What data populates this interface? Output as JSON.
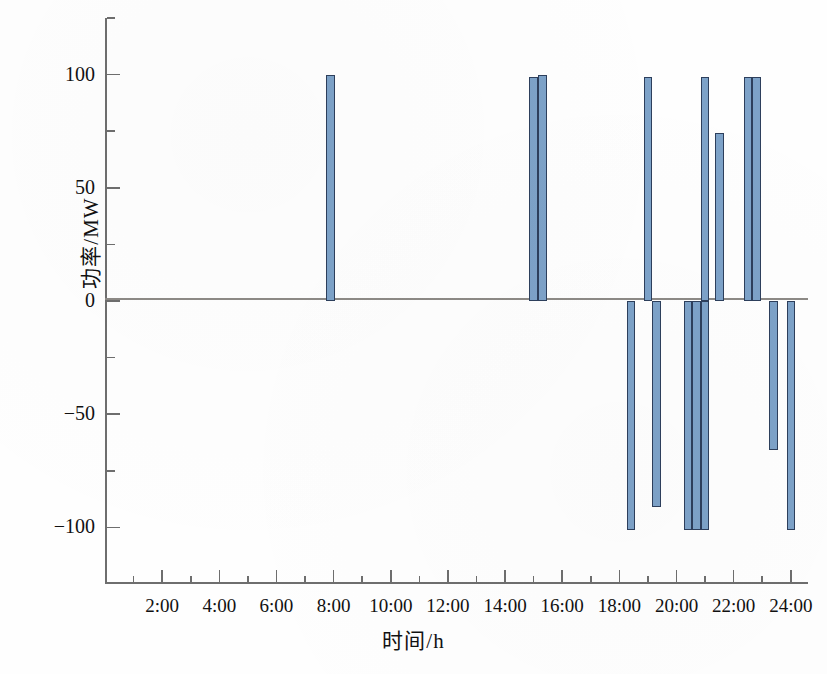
{
  "figure": {
    "ylabel": "功率/MW",
    "xlabel": "时间/h"
  },
  "chart_data": {
    "type": "bar",
    "title": "",
    "xlabel": "时间/h",
    "ylabel": "功率/MW",
    "xlim": [
      0,
      24.6
    ],
    "ylim": [
      -125,
      125
    ],
    "grid": false,
    "legend": null,
    "x_tick_labels": [
      "2:00",
      "4:00",
      "6:00",
      "8:00",
      "10:00",
      "12:00",
      "14:00",
      "16:00",
      "18:00",
      "20:00",
      "22:00",
      "24:00"
    ],
    "x_tick_values": [
      2,
      4,
      6,
      8,
      10,
      12,
      14,
      16,
      18,
      20,
      22,
      24
    ],
    "x_minor_tick_values": [
      1,
      3,
      5,
      7,
      9,
      11,
      13,
      15,
      17,
      19,
      21,
      23
    ],
    "y_tick_labels": [
      "100",
      "50",
      "0",
      "−50",
      "−100"
    ],
    "y_tick_values": [
      100,
      50,
      0,
      -50,
      -100
    ],
    "y_minor_tick_values": [
      75,
      25,
      -25,
      -75,
      125
    ],
    "bar_fill_color": "#7da2c8",
    "bar_edge_color": "#2d3f5c",
    "bar_width_hours": 0.3,
    "bars": [
      {
        "time": 7.9,
        "label": "8:00",
        "value": 100
      },
      {
        "time": 15.0,
        "label": "15:00",
        "value": 99
      },
      {
        "time": 15.3,
        "label": "15:20",
        "value": 100
      },
      {
        "time": 18.4,
        "label": "18:25",
        "value": -101
      },
      {
        "time": 19.0,
        "label": "19:00",
        "value": 99
      },
      {
        "time": 19.3,
        "label": "19:20",
        "value": -91
      },
      {
        "time": 20.4,
        "label": "20:25",
        "value": -101
      },
      {
        "time": 20.7,
        "label": "20:40",
        "value": -101
      },
      {
        "time": 21.0,
        "label": "21:00",
        "value": 99
      },
      {
        "time": 21.0,
        "label": "21:00",
        "value": -101
      },
      {
        "time": 21.5,
        "label": "21:30",
        "value": 74
      },
      {
        "time": 22.5,
        "label": "22:30",
        "value": 99
      },
      {
        "time": 22.8,
        "label": "22:50",
        "value": 99
      },
      {
        "time": 23.4,
        "label": "23:25",
        "value": -66
      },
      {
        "time": 24.0,
        "label": "24:00",
        "value": -101
      }
    ]
  }
}
